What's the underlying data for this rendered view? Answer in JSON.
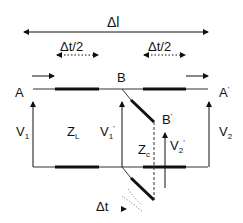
{
  "diagram": {
    "labels": {
      "delta_l": "Δl",
      "delta_t_half_left": "Δt/2",
      "delta_t_half_right": "Δt/2",
      "node_A": "A",
      "node_A_prime": "A",
      "node_B": "B",
      "node_B_prime": "B",
      "v1": "V",
      "v1_sub": "1",
      "z_l": "Z",
      "z_l_sub": "L",
      "v1_prime": "V",
      "v1_prime_sub": "1",
      "z_c": "Z",
      "z_c_sub": "c",
      "v2_prime": "V",
      "v2_prime_sub": "2",
      "v2": "V",
      "v2_sub": "2",
      "delta_t": "Δt",
      "prime_mark": "'"
    },
    "colors": {
      "line": "#111111",
      "background": "#ffffff"
    }
  }
}
